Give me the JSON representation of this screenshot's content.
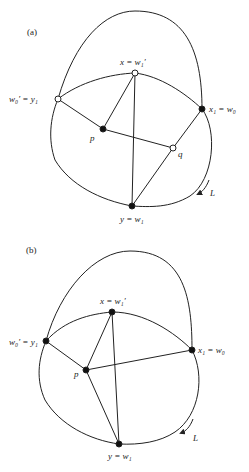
{
  "panels": [
    {
      "label": "(a)",
      "nodes": {
        "w0p": {
          "label": "w₀′ = y₁",
          "style": "open"
        },
        "x": {
          "label": "x = w₁′",
          "style": "open"
        },
        "x1": {
          "label": "x₁ = w₀",
          "style": "filled"
        },
        "p": {
          "label": "p",
          "style": "filled"
        },
        "q": {
          "label": "q",
          "style": "open"
        },
        "y": {
          "label": "y = w₁",
          "style": "filled"
        }
      },
      "curve_label": "L"
    },
    {
      "label": "(b)",
      "nodes": {
        "w0p": {
          "label": "w₀′ = y₁",
          "style": "filled"
        },
        "x": {
          "label": "x = w₁′",
          "style": "filled"
        },
        "x1": {
          "label": "x₁ = w₀",
          "style": "filled"
        },
        "p": {
          "label": "p",
          "style": "filled"
        },
        "y": {
          "label": "y = w₁",
          "style": "filled"
        }
      },
      "curve_label": "L"
    }
  ]
}
